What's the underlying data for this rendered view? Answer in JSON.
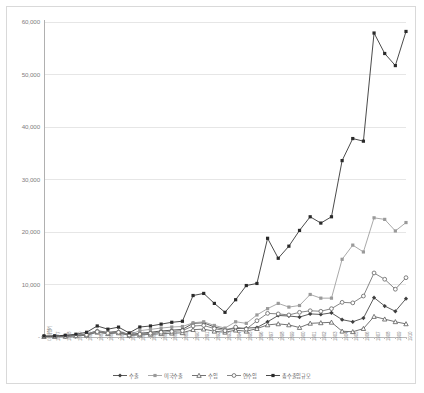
{
  "chart_data": {
    "type": "line",
    "title": "",
    "xlabel": "",
    "ylabel": "",
    "ylim": [
      0,
      60000
    ],
    "ytick_labels": [
      "60,000",
      "50,000",
      "40,000",
      "30,000",
      "20,000",
      "10,000",
      "-"
    ],
    "yticks": [
      60000,
      50000,
      40000,
      30000,
      20000,
      10000,
      0
    ],
    "grid": true,
    "legend_position": "bottom",
    "categories": [
      "미개항기",
      "1877",
      "1878",
      "1879",
      "1880",
      "1881",
      "1882",
      "1883",
      "1884",
      "1885",
      "1886",
      "1887",
      "1888",
      "1889",
      "1890",
      "1891",
      "1892",
      "1893",
      "1894",
      "1895",
      "1896",
      "1897",
      "1898",
      "1899",
      "1900",
      "1901",
      "1902",
      "1903",
      "1904",
      "1905",
      "1906",
      "1907",
      "1908",
      "1909",
      "1910"
    ],
    "series": [
      {
        "name": "수출",
        "color": "#3f3f3f",
        "marker": "diamond",
        "values": [
          120,
          130,
          210,
          330,
          560,
          1200,
          870,
          1100,
          480,
          700,
          900,
          1150,
          1300,
          1450,
          2600,
          2700,
          1900,
          1450,
          1600,
          1700,
          1800,
          2900,
          4100,
          4000,
          3800,
          4400,
          4300,
          4600,
          3300,
          2900,
          3600,
          7500,
          5900,
          4900,
          7300
        ]
      },
      {
        "name": "미국수출",
        "color": "#9a9a9a",
        "marker": "square",
        "values": [
          90,
          110,
          180,
          300,
          520,
          1150,
          800,
          1000,
          420,
          1200,
          1450,
          1700,
          1900,
          2000,
          2700,
          2900,
          2200,
          1700,
          2900,
          2600,
          4200,
          5400,
          6400,
          5700,
          6000,
          8100,
          7400,
          7400,
          14800,
          17500,
          16200,
          22700,
          22400,
          20200,
          21800
        ]
      },
      {
        "name": "수입",
        "color": "#5a5a5a",
        "marker": "triangle",
        "values": [
          70,
          80,
          120,
          200,
          340,
          900,
          620,
          780,
          300,
          400,
          500,
          620,
          720,
          800,
          1400,
          1500,
          1100,
          900,
          1300,
          1100,
          1600,
          2300,
          2500,
          2300,
          1800,
          2600,
          2700,
          2800,
          1100,
          1000,
          1600,
          3900,
          3400,
          2900,
          2500
        ]
      },
      {
        "name": "연수입",
        "color": "#707070",
        "marker": "circle",
        "values": [
          80,
          95,
          150,
          250,
          420,
          1000,
          720,
          900,
          360,
          550,
          700,
          900,
          1050,
          1200,
          2100,
          2200,
          1600,
          1200,
          1900,
          1500,
          3100,
          4500,
          4400,
          4200,
          4700,
          5000,
          4900,
          5400,
          6600,
          6500,
          7800,
          12200,
          11000,
          9100,
          11300
        ]
      },
      {
        "name": "총수출입규모",
        "color": "#2a2a2a",
        "marker": "square-filled",
        "values": [
          190,
          210,
          330,
          530,
          900,
          2100,
          1490,
          1880,
          780,
          1900,
          2100,
          2450,
          2800,
          3000,
          7900,
          8300,
          6400,
          4700,
          7100,
          9800,
          10200,
          18800,
          15000,
          17300,
          20300,
          22900,
          21700,
          22900,
          33600,
          37800,
          37300,
          57900,
          54000,
          51700,
          58200
        ]
      }
    ]
  }
}
